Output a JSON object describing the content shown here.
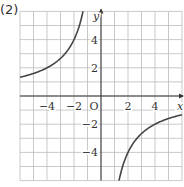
{
  "problem_label": "(2)",
  "chart_data": {
    "type": "line",
    "title": "",
    "function": "y = -8/x",
    "xlabel": "x",
    "ylabel": "y",
    "origin_label": "O",
    "xlim": [
      -6,
      6
    ],
    "ylim": [
      -6,
      6
    ],
    "grid": true,
    "x_ticks": [
      "-4",
      "-2",
      "2",
      "4"
    ],
    "y_ticks": [
      "4",
      "2",
      "-2",
      "-4"
    ],
    "series": [
      {
        "name": "branch-left",
        "x": [
          -6,
          -4,
          -2,
          -1.33
        ],
        "y": [
          1.33,
          2,
          4,
          6
        ]
      },
      {
        "name": "branch-right",
        "x": [
          1.33,
          2,
          4,
          6
        ],
        "y": [
          -6,
          -4,
          -2,
          -1.33
        ]
      }
    ]
  }
}
